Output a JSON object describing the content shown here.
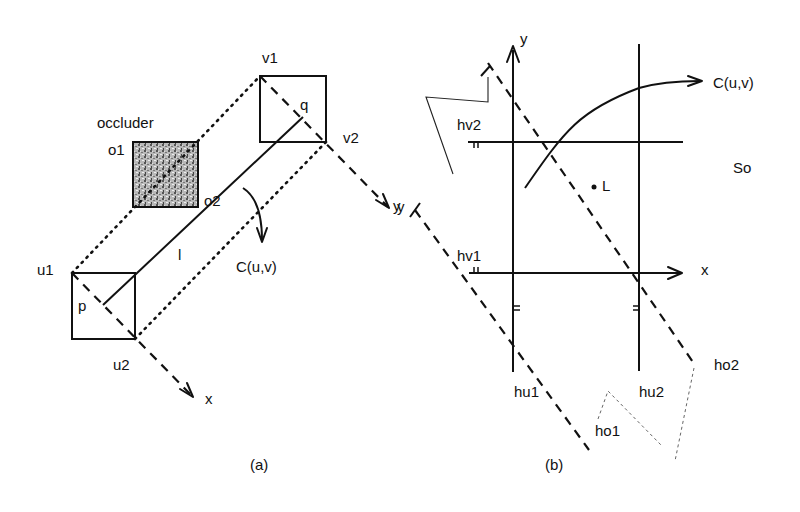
{
  "panel_a": {
    "caption": "(a)",
    "labels": {
      "occluder": "occluder",
      "o1": "o1",
      "o2": "o2",
      "v1": "v1",
      "v2": "v2",
      "u1": "u1",
      "u2": "u2",
      "p": "p",
      "q": "q",
      "l": "l",
      "curve": "C(u,v)",
      "axis_x": "x",
      "axis_y": "y"
    },
    "colors": {
      "occluder_fill": "#9a9a9a"
    }
  },
  "panel_b": {
    "caption": "(b)",
    "labels": {
      "axis_y": "y",
      "axis_x": "x",
      "curve": "C(u,v)",
      "hv2": "hv2",
      "hv1": "hv1",
      "hu1": "hu1",
      "hu2": "hu2",
      "ho1": "ho1",
      "ho2": "ho2",
      "region": "So",
      "point": "L",
      "skew_axis_y": "y"
    }
  }
}
